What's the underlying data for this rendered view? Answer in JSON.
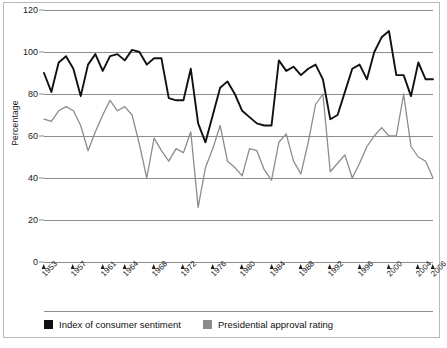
{
  "chart_data": {
    "type": "line",
    "title": "",
    "xlabel": "",
    "ylabel": "Percentage",
    "ylim": [
      0,
      120
    ],
    "yticks": [
      0,
      20,
      40,
      60,
      80,
      100,
      120
    ],
    "xlim": [
      1953,
      2006
    ],
    "xticks": [
      1953,
      1957,
      1961,
      1964,
      1968,
      1972,
      1976,
      1980,
      1984,
      1988,
      1992,
      1996,
      2000,
      2004,
      2006
    ],
    "xtick_labels": [
      "1953",
      "1957",
      "1961",
      "1964",
      "1968",
      "1972",
      "1976",
      "1980",
      "1984",
      "1988",
      "1992",
      "1996",
      "2000",
      "2004",
      "2006"
    ],
    "grid": true,
    "legend_position": "bottom-left",
    "series": [
      {
        "name": "Index of consumer sentiment",
        "color": "#111111",
        "x": [
          1953,
          1954,
          1955,
          1956,
          1957,
          1958,
          1959,
          1960,
          1961,
          1962,
          1963,
          1964,
          1965,
          1966,
          1967,
          1968,
          1969,
          1970,
          1971,
          1972,
          1973,
          1974,
          1975,
          1976,
          1977,
          1978,
          1979,
          1980,
          1981,
          1982,
          1983,
          1984,
          1985,
          1986,
          1987,
          1988,
          1989,
          1990,
          1991,
          1992,
          1993,
          1994,
          1995,
          1996,
          1997,
          1998,
          1999,
          2000,
          2001,
          2002,
          2003,
          2004,
          2005,
          2006
        ],
        "values": [
          90,
          81,
          95,
          98,
          92,
          79,
          94,
          99,
          91,
          98,
          99,
          96,
          101,
          100,
          94,
          97,
          97,
          78,
          77,
          77,
          92,
          66,
          57,
          70,
          83,
          86,
          80,
          72,
          69,
          66,
          65,
          65,
          96,
          91,
          93,
          89,
          92,
          94,
          87,
          68,
          70,
          81,
          92,
          94,
          87,
          100,
          107,
          110,
          89,
          89,
          79,
          95,
          87,
          87
        ],
        "ymin": 57,
        "ymax": 110
      },
      {
        "name": "Presidential approval rating",
        "color": "#8c8c8c",
        "x": [
          1953,
          1954,
          1955,
          1956,
          1957,
          1958,
          1959,
          1960,
          1961,
          1962,
          1963,
          1964,
          1965,
          1966,
          1967,
          1968,
          1969,
          1970,
          1971,
          1972,
          1973,
          1974,
          1975,
          1976,
          1977,
          1978,
          1979,
          1980,
          1981,
          1982,
          1983,
          1984,
          1985,
          1986,
          1987,
          1988,
          1989,
          1990,
          1991,
          1992,
          1993,
          1994,
          1995,
          1996,
          1997,
          1998,
          1999,
          2000,
          2001,
          2002,
          2003,
          2004,
          2005,
          2006
        ],
        "values": [
          68,
          67,
          72,
          74,
          72,
          65,
          53,
          62,
          70,
          77,
          72,
          74,
          70,
          56,
          40,
          59,
          53,
          48,
          54,
          52,
          62,
          26,
          45,
          54,
          65,
          48,
          45,
          41,
          54,
          53,
          44,
          39,
          57,
          61,
          48,
          42,
          57,
          75,
          80,
          43,
          47,
          51,
          40,
          47,
          55,
          60,
          64,
          60,
          60,
          80,
          55,
          50,
          48,
          40
        ],
        "ymin": 26,
        "ymax": 80
      }
    ]
  },
  "axis": {
    "ylabel": "Percentage",
    "ytick_labels": [
      "0",
      "20",
      "40",
      "60",
      "80",
      "100",
      "120"
    ]
  },
  "legend": {
    "items": [
      {
        "label": "Index of consumer sentiment",
        "color": "#111111"
      },
      {
        "label": "Presidential approval rating",
        "color": "#8c8c8c"
      }
    ]
  },
  "footnote": {
    "text": ""
  }
}
